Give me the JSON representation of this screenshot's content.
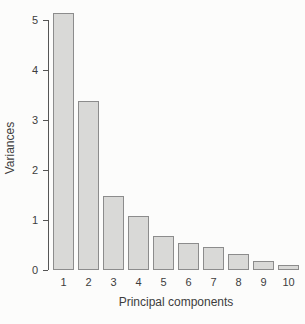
{
  "chart_data": {
    "type": "bar",
    "title": "",
    "xlabel": "Principal components",
    "ylabel": "Variances",
    "categories": [
      "1",
      "2",
      "3",
      "4",
      "5",
      "6",
      "7",
      "8",
      "9",
      "10"
    ],
    "values": [
      5.1,
      3.35,
      1.45,
      1.05,
      0.65,
      0.5,
      0.42,
      0.28,
      0.15,
      0.06
    ],
    "ylim": [
      0,
      5
    ],
    "yticks": [
      0,
      1,
      2,
      3,
      4,
      5
    ],
    "grid": false,
    "legend": null,
    "bar_fill_color": "#d9d9d7",
    "bar_border_color": "#8c8c8c",
    "axis_color": "#555555",
    "text_color": "#3d3d3d",
    "background_color": "#fcfcfb"
  }
}
